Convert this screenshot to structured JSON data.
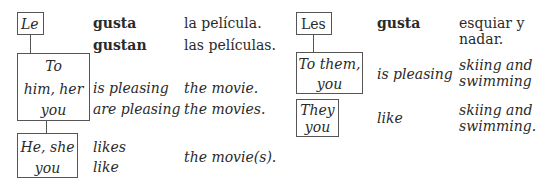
{
  "left_table": {
    "pronoun_box": "Le",
    "gloss_box": {
      "line1": "To",
      "line2": "him, her",
      "line3": "you"
    },
    "subject_box": {
      "line1": "He, she",
      "line2": "you"
    },
    "verbs": {
      "singular": "gusta",
      "plural": "gustan"
    },
    "objects": {
      "singular": "la película.",
      "plural": "las películas."
    },
    "literal": {
      "verb_singular": "is pleasing",
      "verb_plural": "are pleasing",
      "object_singular": "the movie.",
      "object_plural": "the movies."
    },
    "idiomatic": {
      "verb_singular": "likes",
      "verb_plural": "like",
      "object": "the movie(s)."
    }
  },
  "right_table": {
    "pronoun_box": "Les",
    "gloss_box": {
      "line1": "To them,",
      "line2": "you"
    },
    "subject_box": {
      "line1": "They",
      "line2": "you"
    },
    "verb": "gusta",
    "object": {
      "line1": "esquiar y",
      "line2": "nadar."
    },
    "literal": {
      "verb": "is pleasing",
      "object_line1": "skiing and",
      "object_line2": "swimming"
    },
    "idiomatic": {
      "verb": "like",
      "object_line1": "skiing and",
      "object_line2": "swimming."
    }
  }
}
